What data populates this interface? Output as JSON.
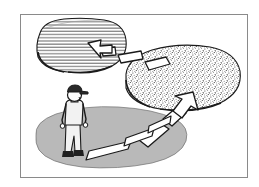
{
  "figure": {
    "title": "Stepping-stone path illustration",
    "caption": "",
    "style": "black-and-white line art",
    "frame": {
      "border_color": "#8a8a8a",
      "background_color": "#ffffff",
      "x": 20,
      "y": 14,
      "width": 227,
      "height": 163
    }
  },
  "palette": {
    "ink": "#1a1a1a",
    "ground_fill": "#b9b9b9",
    "stone_fill": "#ffffff",
    "hatch_fill": "#ffffff",
    "stipple_fill": "#ffffff",
    "figure_body_fill": "#f2f2f2",
    "figure_dark_fill": "#1f1f1f",
    "paper": "#ffffff"
  },
  "scene": {
    "regions": [
      {
        "id": "hatched-cloud",
        "label": "",
        "texture": "horizontal-hatch",
        "fill": "#ffffff",
        "cx": 81,
        "cy": 45,
        "rx": 45,
        "ry": 26,
        "hatch_spacing": 3.2,
        "order": 3
      },
      {
        "id": "stippled-cloud",
        "label": "",
        "texture": "stipple",
        "fill": "#ffffff",
        "cx": 182,
        "cy": 79,
        "rx": 58,
        "ry": 31,
        "stipple_density": 1100,
        "order": 2
      },
      {
        "id": "ground-ellipse",
        "label": "",
        "texture": "solid-gray",
        "fill": "#b9b9b9",
        "cx": 110,
        "cy": 138,
        "rx": 75,
        "ry": 28,
        "order": 1
      }
    ],
    "stepping_stones": [
      {
        "id": "stone-1",
        "points": "63,160 108,151 112,142 68,150"
      },
      {
        "id": "stone-2",
        "points": "113,150 148,140 150,131 114,141"
      },
      {
        "id": "stone-3",
        "points": "152,139 178,128 179,120 152,130"
      }
    ],
    "arrows": [
      {
        "id": "arrow-ground-to-stipple",
        "from": "ground-ellipse",
        "to": "stippled-cloud",
        "direction": "up-right",
        "segments": 2,
        "head_at": {
          "x": 193,
          "y": 92
        }
      },
      {
        "id": "arrow-stipple-to-hatch",
        "from": "stippled-cloud",
        "to": "hatched-cloud",
        "direction": "up-left",
        "segments": 3,
        "head_at": {
          "x": 88,
          "y": 43
        }
      }
    ],
    "figure": {
      "id": "standing-person",
      "label": "",
      "pose": "standing, facing right, arms at sides",
      "headwear": "cap",
      "x": 60,
      "y": 92,
      "width": 28,
      "height": 72
    }
  }
}
